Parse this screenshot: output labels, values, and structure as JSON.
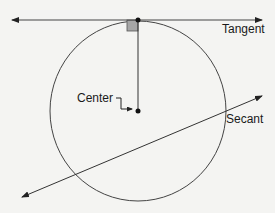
{
  "diagram": {
    "labels": {
      "tangent": "Tangent",
      "center": "Center",
      "secant": "Secant"
    },
    "colors": {
      "background": "#f4f4f2",
      "line": "#333333",
      "right_angle_fill": "#a6a6a6"
    },
    "circle": {
      "cx": 138,
      "cy": 111,
      "rx": 88,
      "ry": 90
    },
    "tangent_point": {
      "x": 138,
      "y": 20
    },
    "tangent_line": {
      "x1": 12,
      "y1": 20,
      "x2": 262,
      "y2": 20
    },
    "radius_line": {
      "x1": 138,
      "y1": 20,
      "x2": 138,
      "y2": 111
    },
    "secant_line": {
      "x1": 22,
      "y1": 197,
      "x2": 262,
      "y2": 96
    }
  }
}
